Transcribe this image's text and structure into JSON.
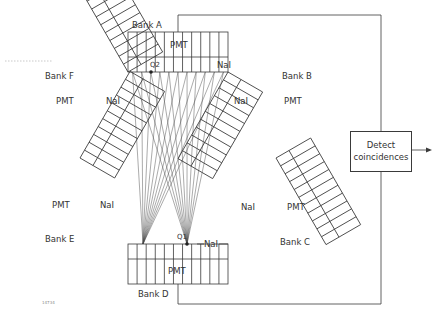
{
  "diagram": {
    "type": "detector ring schematic",
    "banks": [
      {
        "id": "A",
        "label": "Bank A",
        "pmt": "PMT",
        "crystal": "NaI",
        "position": "top"
      },
      {
        "id": "B",
        "label": "Bank B",
        "pmt": "PMT",
        "crystal": "NaI",
        "position": "upper-right"
      },
      {
        "id": "C",
        "label": "Bank C",
        "pmt": "PMT",
        "crystal": "NaI",
        "position": "lower-right"
      },
      {
        "id": "D",
        "label": "Bank D",
        "pmt": "PMT",
        "crystal": "NaI",
        "position": "bottom"
      },
      {
        "id": "E",
        "label": "Bank E",
        "pmt": "PMT",
        "crystal": "NaI",
        "position": "lower-left"
      },
      {
        "id": "F",
        "label": "Bank F",
        "pmt": "PMT",
        "crystal": "NaI",
        "position": "upper-left"
      }
    ],
    "points": {
      "q1": "Q1",
      "q2": "Q2"
    },
    "coincidence_box": {
      "line1": "Detect",
      "line2": "coincidences"
    },
    "figure_id": "14734"
  },
  "colors": {
    "line": "#3a3a3a",
    "background": "#ffffff"
  }
}
